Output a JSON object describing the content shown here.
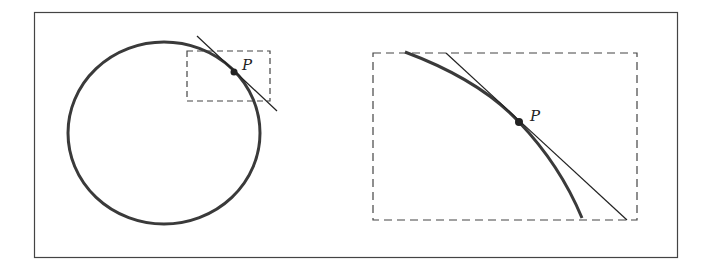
{
  "diagram": {
    "left_panel": {
      "point_label": "P",
      "shape": "circle",
      "zoom_region": "dashed rectangle around P"
    },
    "right_panel": {
      "point_label": "P",
      "content": "magnified view of dashed region"
    },
    "colors": {
      "curve": "#3a3a3a",
      "tangent": "#222222",
      "frame": "#444444",
      "dashed": "#444444"
    }
  }
}
